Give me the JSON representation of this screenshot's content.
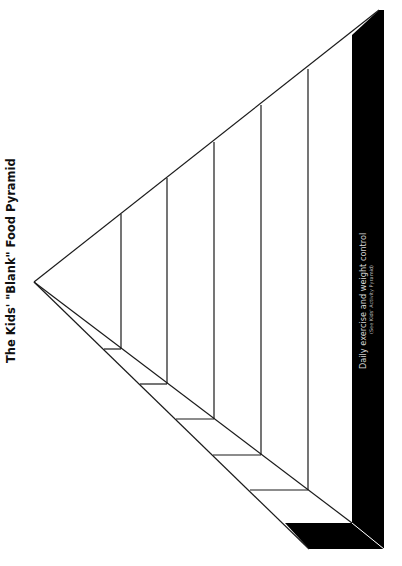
{
  "title": "The Kids' \"Blank\" Food Pyramid",
  "base_band": {
    "label": "Daily exercise and weight control",
    "sublabel": "(See Kids' Activity Pyramid)",
    "color": "#000000"
  },
  "pyramid": {
    "orientation": "rotated 90 degrees counter-clockwise (apex at left)",
    "blank_sections": 6,
    "line_color": "#1a1a1a",
    "background": "#ffffff"
  }
}
